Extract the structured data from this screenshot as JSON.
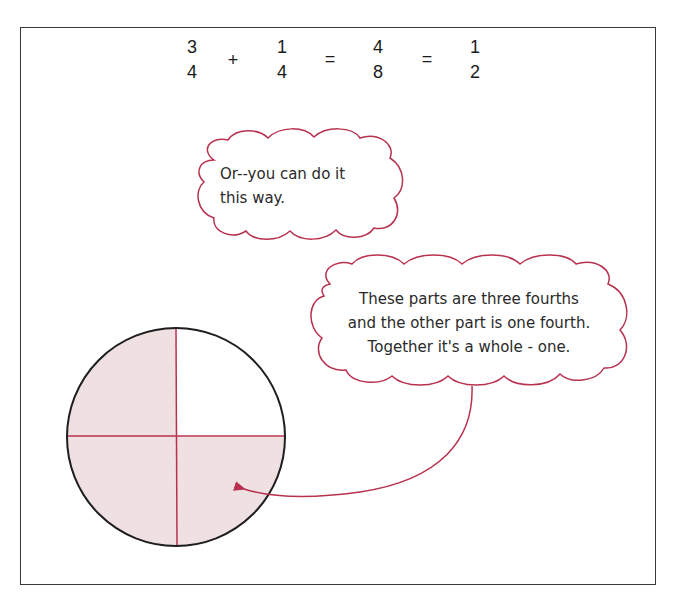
{
  "equation": {
    "terms": [
      {
        "numerator": "3",
        "denominator": "4"
      },
      {
        "numerator": "1",
        "denominator": "4"
      },
      {
        "numerator": "4",
        "denominator": "8"
      },
      {
        "numerator": "1",
        "denominator": "2"
      }
    ],
    "operators": [
      "+",
      "=",
      "="
    ]
  },
  "bubbles": [
    {
      "lines": [
        "Or--you can do it",
        "this way."
      ]
    },
    {
      "lines": [
        "These parts are three fourths",
        "and the other part is one fourth.",
        "Together it's a whole - one."
      ]
    }
  ],
  "circle": {
    "quarters": [
      {
        "position": "top-left",
        "shaded": true
      },
      {
        "position": "top-right",
        "shaded": false
      },
      {
        "position": "bottom-left",
        "shaded": true
      },
      {
        "position": "bottom-right",
        "shaded": true
      }
    ],
    "shaded_fraction": "3/4",
    "unshaded_fraction": "1/4"
  },
  "colors": {
    "accent": "#b8324f",
    "shade": "#efe0e2",
    "outline": "#1e1e1e"
  }
}
